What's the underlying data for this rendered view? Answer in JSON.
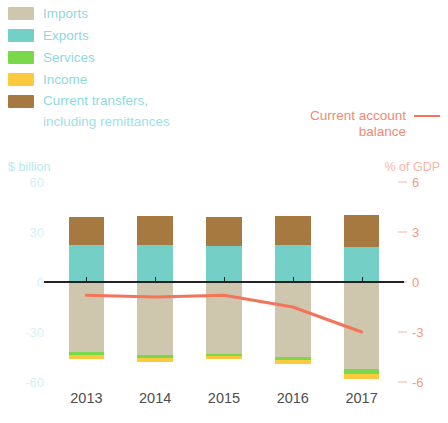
{
  "legend": {
    "items": [
      {
        "label": "Imports",
        "color": "#cfc6ae"
      },
      {
        "label": "Exports",
        "color": "#74cfc6"
      },
      {
        "label": "Services",
        "color": "#79d94a"
      },
      {
        "label": "Income",
        "color": "#fcc93f"
      },
      {
        "label": "Current transfers,",
        "sublabel": "including remittances",
        "color": "#a5793f"
      }
    ],
    "line_series": {
      "label_line1": "Current account",
      "label_line2": "balance",
      "color": "#f4745a"
    }
  },
  "axes": {
    "left_unit": "$ billion",
    "right_unit": "% of GDP",
    "left_ticks": [
      "60",
      "30",
      "0",
      "-30",
      "-60"
    ],
    "right_ticks": [
      "6",
      "3",
      "0",
      "-3",
      "-6"
    ]
  },
  "chart_data": {
    "type": "bar",
    "title": "",
    "subtitle": "",
    "xlabel": "",
    "ylabel": "$ billion",
    "y2label": "% of GDP",
    "ylim": [
      -60,
      60
    ],
    "y2lim": [
      -6,
      6
    ],
    "grid": false,
    "legend_position": "top-left",
    "categories": [
      "2013",
      "2014",
      "2015",
      "2016",
      "2017"
    ],
    "series": [
      {
        "name": "Exports",
        "color": "#74cfc6",
        "stack": "positive",
        "values": [
          22.5,
          22.0,
          21.5,
          22.0,
          21.0
        ]
      },
      {
        "name": "Current transfers, including remittances",
        "color": "#a5793f",
        "stack": "positive",
        "values": [
          16.5,
          17.5,
          17.5,
          17.5,
          19.5
        ]
      },
      {
        "name": "Imports",
        "color": "#cfc6ae",
        "stack": "negative",
        "values": [
          -42.0,
          -44.0,
          -43.0,
          -45.0,
          -52.0
        ]
      },
      {
        "name": "Services",
        "color": "#79d94a",
        "stack": "negative",
        "values": [
          -2.0,
          -1.5,
          -1.5,
          -2.0,
          -3.0
        ]
      },
      {
        "name": "Income",
        "color": "#fcc93f",
        "stack": "negative",
        "values": [
          -2.0,
          -2.5,
          -2.0,
          -2.5,
          -3.5
        ]
      }
    ],
    "line_series": {
      "name": "Current account balance",
      "color": "#f4745a",
      "axis": "right",
      "unit": "% of GDP",
      "x": [
        "2013",
        "2014",
        "2015",
        "2016",
        "2017"
      ],
      "values": [
        -0.8,
        -0.9,
        -0.8,
        -1.5,
        -3.0
      ]
    }
  },
  "xaxis": {
    "labels": [
      "2013",
      "2014",
      "2015",
      "2016",
      "2017"
    ]
  }
}
